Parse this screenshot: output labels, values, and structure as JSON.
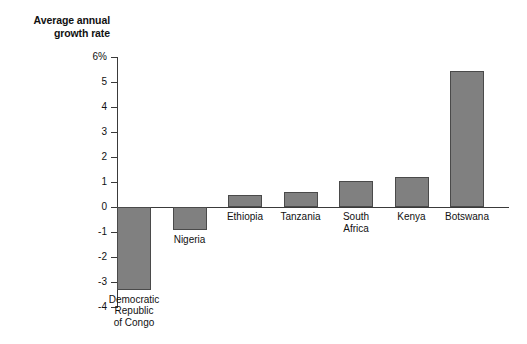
{
  "chart_data": {
    "type": "bar",
    "title": "Average annual\ngrowth rate",
    "title_line1": "Average annual",
    "title_line2": "growth rate",
    "xlabel": "",
    "ylabel": "Average annual growth rate",
    "ylim": [
      -4,
      6
    ],
    "grid": false,
    "legend": null,
    "ytick_labels": [
      "6%",
      "5",
      "4",
      "3",
      "2",
      "1",
      "0",
      "-1",
      "-2",
      "-3",
      "-4"
    ],
    "ytick_values": [
      6,
      5,
      4,
      3,
      2,
      1,
      0,
      -1,
      -2,
      -3,
      -4
    ],
    "categories": [
      "Democratic\nRepublic\nof Congo",
      "Nigeria",
      "Ethiopia",
      "Tanzania",
      "South\nAfrica",
      "Kenya",
      "Botswana"
    ],
    "values": [
      -3.3,
      -0.9,
      0.5,
      0.6,
      1.05,
      1.2,
      5.45
    ],
    "bar_color": "#808080",
    "bar_edge_color": "#4a4a4a",
    "axis_color": "#3a3a3a",
    "background_color": "#ffffff"
  },
  "ticks": [
    {
      "label": "6%",
      "value": 6
    },
    {
      "label": "5",
      "value": 5
    },
    {
      "label": "4",
      "value": 4
    },
    {
      "label": "3",
      "value": 3
    },
    {
      "label": "2",
      "value": 2
    },
    {
      "label": "1",
      "value": 1
    },
    {
      "label": "0",
      "value": 0
    },
    {
      "label": "-1",
      "value": -1
    },
    {
      "label": "-2",
      "value": -2
    },
    {
      "label": "-3",
      "value": -3
    },
    {
      "label": "-4",
      "value": -4
    }
  ],
  "bars": [
    {
      "name": "Democratic Republic of Congo",
      "label": "Democratic\nRepublic\nof Congo",
      "value": -3.3
    },
    {
      "name": "Nigeria",
      "label": "Nigeria",
      "value": -0.9
    },
    {
      "name": "Ethiopia",
      "label": "Ethiopia",
      "value": 0.5
    },
    {
      "name": "Tanzania",
      "label": "Tanzania",
      "value": 0.6
    },
    {
      "name": "South Africa",
      "label": "South\nAfrica",
      "value": 1.05
    },
    {
      "name": "Kenya",
      "label": "Kenya",
      "value": 1.2
    },
    {
      "name": "Botswana",
      "label": "Botswana",
      "value": 5.45
    }
  ]
}
